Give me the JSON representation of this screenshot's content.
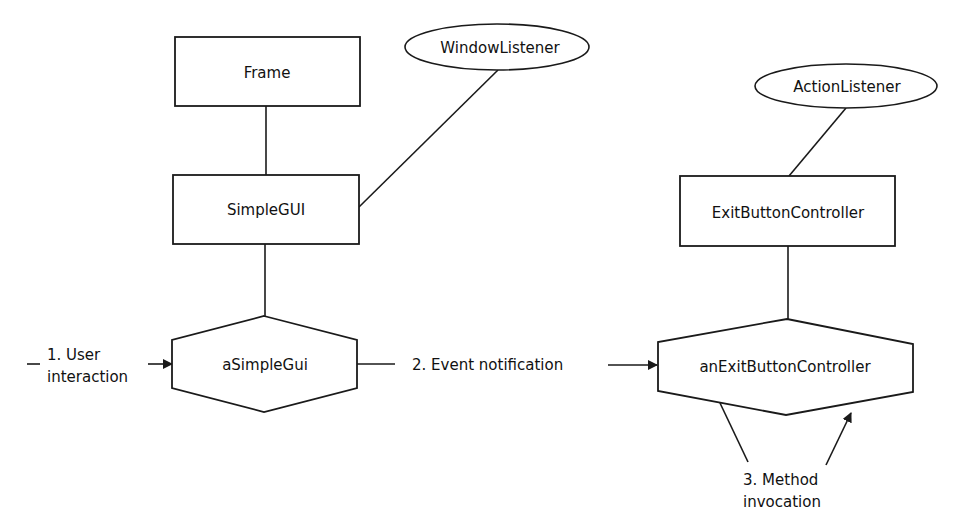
{
  "diagram": {
    "classes": {
      "frame": {
        "label": "Frame"
      },
      "simple_gui": {
        "label": "SimpleGUI"
      },
      "exit_button_controller": {
        "label": "ExitButtonController"
      }
    },
    "interfaces": {
      "window_listener": {
        "label": "WindowListener"
      },
      "action_listener": {
        "label": "ActionListener"
      }
    },
    "objects": {
      "a_simple_gui": {
        "label": "aSimpleGui"
      },
      "an_exit_button_controller": {
        "label": "anExitButtonController"
      }
    },
    "steps": [
      {
        "number": "1.",
        "line1": "1. User",
        "line2": "interaction"
      },
      {
        "number": "2.",
        "line1": "2. Event notification"
      },
      {
        "number": "3.",
        "line1": "3. Method",
        "line2": "invocation"
      }
    ],
    "colors": {
      "stroke": "#1a1a1a",
      "background": "#ffffff",
      "text": "#111111"
    }
  }
}
